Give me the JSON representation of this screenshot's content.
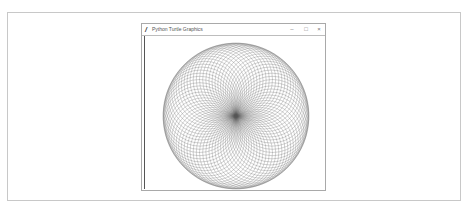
{
  "window": {
    "title": "Python Turtle Graphics",
    "app_icon": "feather-icon",
    "controls": {
      "minimize": "–",
      "maximize": "□",
      "close": "×"
    }
  },
  "canvas": {
    "drawing": "spirograph",
    "pen_color": "#555555",
    "circle_count": 72,
    "description": "Circles of equal radius rotated around a common center point"
  }
}
